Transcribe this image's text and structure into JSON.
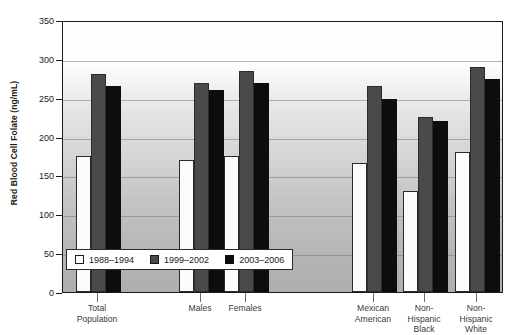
{
  "chart_data": {
    "type": "bar",
    "title": "",
    "xlabel": "",
    "ylabel": "Red Blood Cell Folate (ng/mL)",
    "ylim": [
      0,
      350
    ],
    "yticks": [
      0,
      50,
      100,
      150,
      200,
      250,
      300,
      350
    ],
    "grid": true,
    "legend_position": "inside-bottom-left",
    "categories": [
      "Total\nPopulation",
      "Males",
      "Females",
      "Mexican\nAmerican",
      "Non-\nHispanic\nBlack",
      "Non-\nHispanic\nWhite"
    ],
    "series": [
      {
        "name": "1988–1994",
        "color": "#ffffff",
        "values": [
          175,
          170,
          175,
          166,
          130,
          180
        ]
      },
      {
        "name": "1999–2002",
        "color": "#4a4a4a",
        "values": [
          280,
          269,
          284,
          265,
          225,
          289
        ]
      },
      {
        "name": "2003–2006",
        "color": "#0d0d0d",
        "values": [
          265,
          260,
          269,
          248,
          220,
          274
        ]
      }
    ]
  },
  "legend": {
    "items": [
      {
        "label": "1988–1994",
        "swatch": "white-square-icon"
      },
      {
        "label": "1999–2002",
        "swatch": "gray-square-icon"
      },
      {
        "label": "2003–2006",
        "swatch": "black-square-icon"
      }
    ]
  },
  "axis": {
    "y_title": "Red Blood Cell Folate (ng/mL)",
    "y_tick_labels": [
      "350",
      "300",
      "250",
      "200",
      "150",
      "100",
      "50",
      "0"
    ]
  }
}
